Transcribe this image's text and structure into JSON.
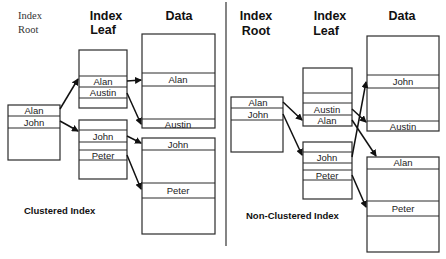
{
  "clustered": {
    "headers": {
      "root_line1": "Index",
      "root_line2": "Root",
      "leaf_line1": "Index",
      "leaf_line2": "Leaf",
      "data": "Data"
    },
    "root": {
      "rows": [
        "Alan",
        "John"
      ]
    },
    "leaf1": {
      "rows": [
        "Alan",
        "Austin"
      ]
    },
    "leaf2": {
      "rows": [
        "John",
        "Peter"
      ]
    },
    "data1": {
      "rows": [
        "Alan",
        "Austin"
      ]
    },
    "data2": {
      "rows": [
        "John",
        "Peter"
      ]
    },
    "caption": "Clustered Index"
  },
  "nonclustered": {
    "headers": {
      "root_line1": "Index",
      "root_line2": "Root",
      "leaf_line1": "Index",
      "leaf_line2": "Leaf",
      "data": "Data"
    },
    "root": {
      "rows": [
        "Alan",
        "John"
      ]
    },
    "leaf1": {
      "rows": [
        "Austin",
        "Alan"
      ]
    },
    "leaf2": {
      "rows": [
        "John",
        "Peter"
      ]
    },
    "data1": {
      "rows": [
        "John",
        "Austin"
      ]
    },
    "data2": {
      "rows": [
        "Alan",
        "Peter"
      ]
    },
    "caption": "Non-Clustered Index"
  }
}
